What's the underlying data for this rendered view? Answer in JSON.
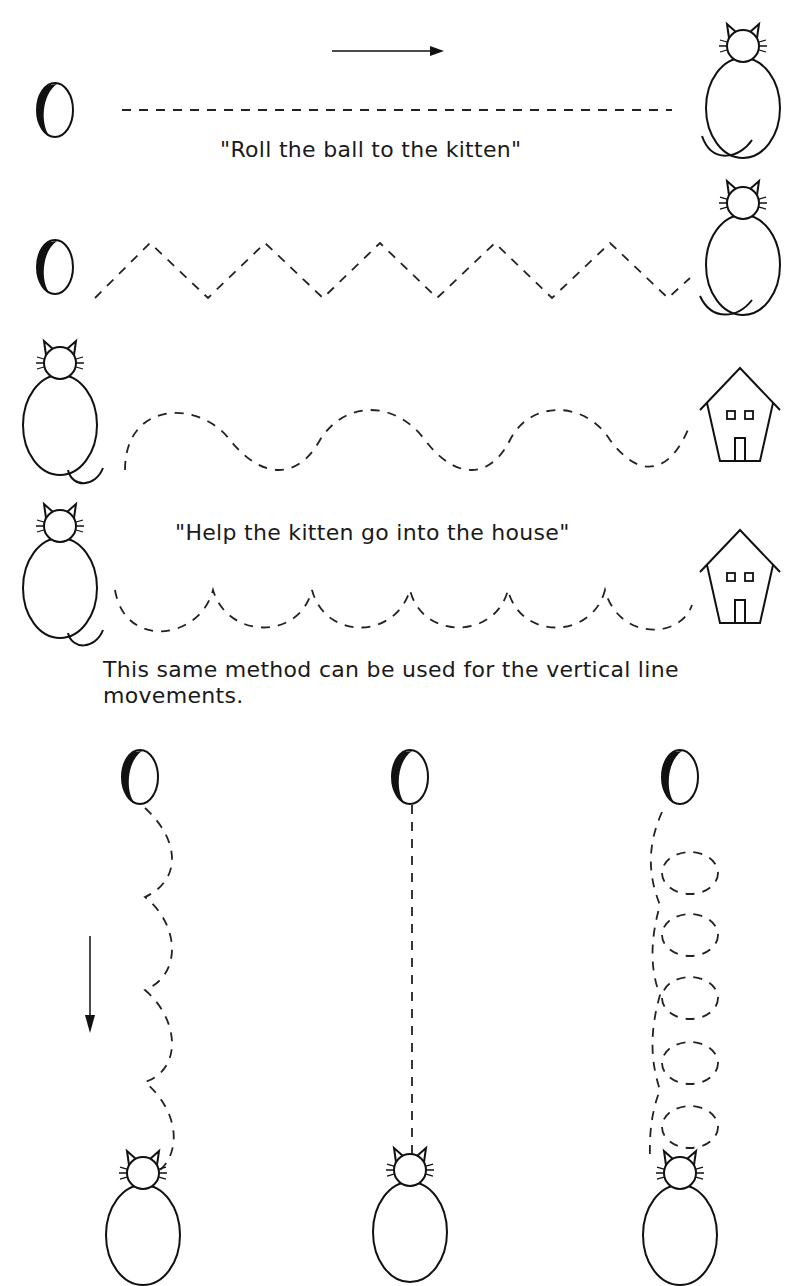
{
  "captions": {
    "roll_ball": "\"Roll the ball to the kitten\"",
    "help_kitten": "\"Help the kitten go into the house\"",
    "vertical_note": "This same method can be used for the vertical line movements."
  },
  "exercises": {
    "horizontal": [
      {
        "start": "ball",
        "end": "kitten",
        "path": "straight-dashed"
      },
      {
        "start": "ball",
        "end": "kitten",
        "path": "zigzag-dashed"
      },
      {
        "start": "kitten",
        "end": "house",
        "path": "wave-dashed"
      },
      {
        "start": "kitten",
        "end": "house",
        "path": "scallop-dashed"
      }
    ],
    "vertical": [
      {
        "start": "ball",
        "end": "kitten",
        "path": "scallop-dashed"
      },
      {
        "start": "ball",
        "end": "kitten",
        "path": "straight-dashed"
      },
      {
        "start": "ball",
        "end": "kitten",
        "path": "loop-dashed"
      }
    ]
  },
  "icons": {
    "arrow_right": "arrow-right-icon",
    "arrow_down": "arrow-down-icon",
    "ball": "ball-icon",
    "kitten": "kitten-icon",
    "house": "house-icon"
  }
}
